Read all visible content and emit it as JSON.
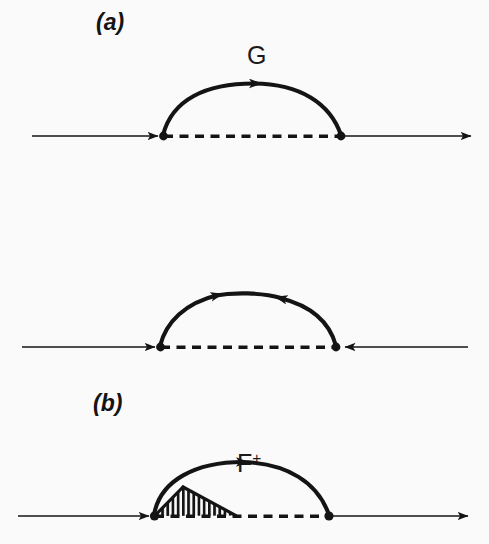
{
  "figure": {
    "width": 489,
    "height": 544,
    "background_color": "#fbfafa",
    "ink_color": "#141414",
    "type": "feynman-diagram-set"
  },
  "panels": [
    {
      "id": "a",
      "label": "(a)",
      "arc_label": "G",
      "arc_label_has_superscript": false,
      "baseline_y": 136,
      "left_vertex_x": 163,
      "right_vertex_x": 341,
      "line_start_x": 32,
      "line_end_x": 477,
      "baseline_left_arrow_direction": "right",
      "baseline_right_arrow_direction": "right",
      "arc_apex_y": 84,
      "arc_arrow_count": 1,
      "arc_arrow_directions": [
        "right"
      ],
      "dashed_between_vertices": true,
      "hatched_region": false
    },
    {
      "id": "b",
      "label": "(b)",
      "arc_label": "F",
      "arc_label_superscript": "+",
      "arc_label_has_superscript": true,
      "baseline_y": 347,
      "left_vertex_x": 160,
      "right_vertex_x": 336,
      "line_start_x": 22,
      "line_end_x": 470,
      "baseline_left_arrow_direction": "right",
      "baseline_right_arrow_direction": "left",
      "arc_apex_y": 298,
      "arc_arrow_count": 2,
      "arc_arrow_directions": [
        "up-right",
        "up-left"
      ],
      "dashed_between_vertices": true,
      "hatched_region": false
    },
    {
      "id": "c",
      "label": "(c)",
      "arc_label": "",
      "arc_label_has_superscript": false,
      "baseline_y": 516,
      "left_vertex_x": 154,
      "right_vertex_x": 329,
      "line_start_x": 18,
      "line_end_x": 470,
      "baseline_left_arrow_direction": "right",
      "baseline_right_arrow_direction": "right",
      "arc_apex_y": 464,
      "arc_arrow_count": 1,
      "arc_arrow_directions": [
        "right"
      ],
      "dashed_between_vertices": true,
      "hatched_region": true,
      "hatch": {
        "style": "vertical-lines",
        "apex_x": 183,
        "apex_y": 487,
        "right_x": 236,
        "line_count": 17
      }
    }
  ],
  "icons": {
    "arrowhead": "arrowhead-icon",
    "vertex_dot": "vertex-dot-icon"
  }
}
